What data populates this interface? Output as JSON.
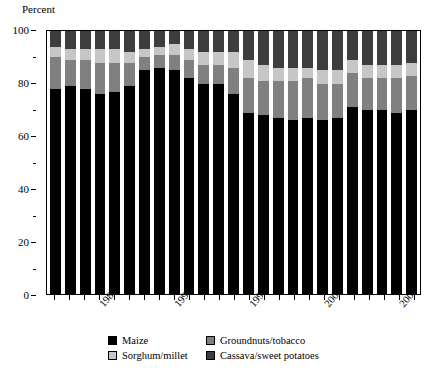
{
  "axis": {
    "y_title": "Percent",
    "y_ticks_major": [
      "0",
      "20",
      "40",
      "60",
      "80",
      "100"
    ],
    "x_tick_labels": [
      "1985",
      "1990",
      "1995",
      "2000",
      "2005"
    ]
  },
  "legend": {
    "entries": [
      {
        "label": "Maize",
        "color": "#000000",
        "key": "maize"
      },
      {
        "label": "Groundnuts/tobacco",
        "color": "#808080",
        "key": "groundnuts"
      },
      {
        "label": "Sorghum/millet",
        "color": "#c6c6c6",
        "key": "sorghum"
      },
      {
        "label": "Cassava/sweet potatoes",
        "color": "#3d3d3d",
        "key": "cassava"
      }
    ]
  },
  "chart_data": {
    "type": "bar",
    "stacked": true,
    "title": "",
    "subtitle": "",
    "xlabel": "",
    "ylabel": "Percent",
    "ylim": [
      0,
      100
    ],
    "y_major_step": 20,
    "y_minor_step": 10,
    "grid": false,
    "legend_position": "bottom",
    "categories": [
      "1982",
      "1983",
      "1984",
      "1985",
      "1986",
      "1987",
      "1988",
      "1989",
      "1990",
      "1991",
      "1992",
      "1993",
      "1994",
      "1995",
      "1996",
      "1997",
      "1998",
      "1999",
      "2000",
      "2001",
      "2002",
      "2003",
      "2004",
      "2005",
      "2006"
    ],
    "series": [
      {
        "name": "Maize",
        "color": "#000000",
        "values": [
          78,
          79,
          78,
          76,
          77,
          79,
          85,
          86,
          85,
          82,
          80,
          80,
          76,
          69,
          68,
          67,
          66,
          67,
          66,
          67,
          71,
          70,
          70,
          69,
          70
        ]
      },
      {
        "name": "Groundnuts/tobacco",
        "color": "#808080",
        "values": [
          12,
          10,
          11,
          12,
          11,
          9,
          5,
          5,
          6,
          7,
          7,
          7,
          10,
          13,
          13,
          14,
          15,
          15,
          14,
          13,
          13,
          12,
          12,
          13,
          13
        ]
      },
      {
        "name": "Sorghum/millet",
        "color": "#c6c6c6",
        "values": [
          4,
          4,
          4,
          5,
          5,
          4,
          3,
          3,
          4,
          4,
          5,
          5,
          6,
          7,
          6,
          5,
          5,
          4,
          5,
          5,
          5,
          5,
          5,
          5,
          5
        ]
      },
      {
        "name": "Cassava/sweet potatoes",
        "color": "#3d3d3d",
        "values": [
          6,
          7,
          7,
          7,
          7,
          8,
          7,
          6,
          5,
          7,
          8,
          8,
          8,
          11,
          13,
          14,
          14,
          14,
          15,
          15,
          11,
          13,
          13,
          13,
          12
        ]
      }
    ]
  }
}
